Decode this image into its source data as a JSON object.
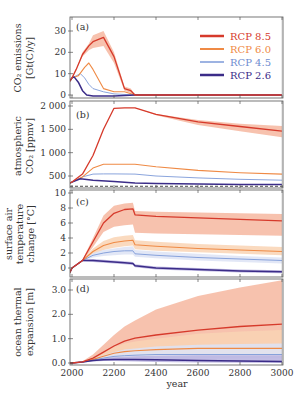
{
  "chart_data": [
    {
      "panel": "(a)",
      "type": "line",
      "ylabel": "CO2 emissions [Gt(C)/y]",
      "ylabel_lines": [
        "CO₂ emissions",
        "[Gt(C)/y]"
      ],
      "yticks": [
        0,
        10,
        20,
        30
      ],
      "ylim": [
        -1.5,
        37
      ],
      "xlim": [
        1990,
        3000
      ],
      "grid": false,
      "legend_position": "upper right",
      "series": [
        {
          "name": "RCP 8.5",
          "color": "#d63a2b",
          "x": [
            1990,
            2000,
            2020,
            2050,
            2080,
            2100,
            2150,
            2200,
            2250,
            2280,
            2300,
            3000
          ],
          "values": [
            6.5,
            8,
            12,
            19,
            23,
            25,
            27,
            18,
            3,
            2,
            0,
            0
          ],
          "band_upper": [
            6.5,
            8,
            12,
            20,
            24,
            28,
            30,
            20,
            4,
            3,
            0,
            0
          ],
          "band_lower": [
            6.5,
            8,
            12,
            18,
            21,
            22,
            23,
            15,
            2,
            1,
            0,
            0
          ]
        },
        {
          "name": "RCP 6.0",
          "color": "#ef8a45",
          "x": [
            1990,
            2000,
            2030,
            2060,
            2080,
            2100,
            2150,
            2200,
            2250,
            2300,
            3000
          ],
          "values": [
            6.5,
            8,
            9,
            13,
            15,
            12,
            3,
            1.5,
            1.5,
            0,
            0
          ]
        },
        {
          "name": "RCP 4.5",
          "color": "#7d9ad8",
          "x": [
            1990,
            2000,
            2020,
            2040,
            2060,
            2080,
            2100,
            2150,
            2200,
            2300,
            3000
          ],
          "values": [
            6.5,
            8,
            9,
            10,
            8,
            5,
            3,
            1.5,
            0.5,
            0,
            0
          ]
        },
        {
          "name": "RCP 2.6",
          "color": "#3b2c88",
          "x": [
            1990,
            2000,
            2010,
            2030,
            2050,
            2070,
            2100,
            2200,
            2300,
            3000
          ],
          "values": [
            6.5,
            8,
            8.5,
            6,
            2,
            0,
            -0.5,
            -0.5,
            0,
            0
          ]
        }
      ]
    },
    {
      "panel": "(b)",
      "type": "line",
      "ylabel": "atmospheric CO2 [ppmv]",
      "ylabel_lines": [
        "atmospheric",
        "CO₂ [ppmv]"
      ],
      "yticks": [
        500,
        1000,
        1500,
        2000
      ],
      "ytick_labels": [
        "500",
        "1 000",
        "1 500",
        "2 000"
      ],
      "ylim": [
        240,
        2100
      ],
      "reference_line": {
        "value": 280,
        "style": "dashed",
        "color": "#333333"
      },
      "series": [
        {
          "name": "RCP 8.5",
          "x": [
            1990,
            2000,
            2050,
            2100,
            2150,
            2200,
            2250,
            2300,
            2400,
            2600,
            2800,
            3000
          ],
          "values": [
            350,
            370,
            540,
            940,
            1500,
            1950,
            1962,
            1962,
            1820,
            1660,
            1560,
            1460
          ],
          "band_upper": [
            350,
            370,
            540,
            940,
            1500,
            1950,
            1962,
            1962,
            1830,
            1700,
            1620,
            1570
          ],
          "band_lower": [
            350,
            370,
            540,
            940,
            1500,
            1950,
            1962,
            1962,
            1800,
            1590,
            1460,
            1330
          ]
        },
        {
          "name": "RCP 6.0",
          "x": [
            1990,
            2000,
            2050,
            2100,
            2150,
            2200,
            2250,
            2300,
            2400,
            2600,
            2800,
            3000
          ],
          "values": [
            350,
            370,
            480,
            670,
            750,
            752,
            752,
            752,
            700,
            620,
            570,
            540
          ]
        },
        {
          "name": "RCP 4.5",
          "x": [
            1990,
            2000,
            2050,
            2100,
            2150,
            2200,
            2300,
            2400,
            2600,
            2800,
            3000
          ],
          "values": [
            350,
            370,
            480,
            540,
            545,
            545,
            540,
            500,
            460,
            430,
            410
          ]
        },
        {
          "name": "RCP 2.6",
          "x": [
            1990,
            2000,
            2040,
            2100,
            2200,
            2300,
            2400,
            2600,
            2800,
            3000
          ],
          "values": [
            350,
            370,
            440,
            410,
            380,
            350,
            340,
            330,
            320,
            315
          ]
        }
      ]
    },
    {
      "panel": "(c)",
      "type": "line",
      "ylabel": "surface air temperature change [°C]",
      "ylabel_lines": [
        "surface air",
        "temperature",
        "change [°C]"
      ],
      "yticks": [
        0,
        2,
        4,
        6,
        8,
        10
      ],
      "ylim": [
        -1.2,
        10.4
      ],
      "series": [
        {
          "name": "RCP 8.5",
          "x": [
            1990,
            2000,
            2050,
            2100,
            2150,
            2200,
            2250,
            2290,
            2300,
            2400,
            2600,
            2800,
            3000
          ],
          "values": [
            -0.6,
            0,
            1,
            3.5,
            6,
            7.3,
            7.8,
            7.9,
            7.1,
            6.9,
            6.7,
            6.5,
            6.3
          ],
          "band_upper": [
            -0.6,
            0,
            1.1,
            4,
            7,
            8.3,
            8.6,
            8.7,
            7.6,
            7.5,
            7.4,
            7.3,
            7.2
          ],
          "band_lower": [
            -0.6,
            0,
            0.9,
            2.8,
            4.8,
            5.5,
            5.7,
            5.8,
            4.7,
            4.6,
            4.5,
            4.4,
            4.3
          ]
        },
        {
          "name": "RCP 6.0",
          "x": [
            1990,
            2000,
            2050,
            2100,
            2150,
            2200,
            2250,
            2290,
            2300,
            2400,
            2600,
            2800,
            3000
          ],
          "values": [
            -0.6,
            0,
            1,
            2.2,
            3,
            3.4,
            3.6,
            3.7,
            3.1,
            2.9,
            2.6,
            2.4,
            2.2
          ],
          "band_upper": [
            -0.6,
            0,
            1.1,
            2.6,
            3.6,
            4.1,
            4.3,
            4.4,
            3.7,
            3.5,
            3.2,
            3.0,
            2.8
          ],
          "band_lower": [
            -0.6,
            0,
            0.9,
            1.8,
            2.4,
            2.7,
            2.9,
            3.0,
            2.5,
            2.3,
            2.1,
            1.9,
            1.7
          ]
        },
        {
          "name": "RCP 4.5",
          "x": [
            1990,
            2000,
            2050,
            2100,
            2150,
            2200,
            2250,
            2290,
            2300,
            2400,
            2600,
            2800,
            3000
          ],
          "values": [
            -0.6,
            0,
            1,
            1.7,
            2.0,
            2.2,
            2.3,
            2.3,
            1.9,
            1.7,
            1.4,
            1.2,
            1.0
          ],
          "band_upper": [
            -0.6,
            0,
            1.1,
            2.0,
            2.4,
            2.6,
            2.8,
            2.9,
            2.4,
            2.2,
            1.9,
            1.6,
            1.4
          ],
          "band_lower": [
            -0.6,
            0,
            0.9,
            1.4,
            1.6,
            1.7,
            1.8,
            1.8,
            1.5,
            1.3,
            1.0,
            0.8,
            0.6
          ]
        },
        {
          "name": "RCP 2.6",
          "x": [
            1990,
            2000,
            2050,
            2100,
            2150,
            2200,
            2250,
            2290,
            2300,
            2400,
            2600,
            2800,
            3000
          ],
          "values": [
            -0.6,
            0,
            1.0,
            1.0,
            0.9,
            0.8,
            0.7,
            0.6,
            0.3,
            0.0,
            -0.2,
            -0.4,
            -0.5
          ],
          "band_upper": [
            -0.6,
            0,
            1.1,
            1.2,
            1.1,
            1.0,
            0.9,
            0.8,
            0.5,
            0.2,
            0.0,
            -0.2,
            -0.3
          ],
          "band_lower": [
            -0.6,
            0,
            0.9,
            0.8,
            0.7,
            0.6,
            0.5,
            0.4,
            0.1,
            -0.2,
            -0.4,
            -0.6,
            -0.7
          ]
        }
      ]
    },
    {
      "panel": "(d)",
      "type": "line",
      "ylabel": "ocean thermal expansion [m]",
      "ylabel_lines": [
        "ocean thermal",
        "expansion [m]"
      ],
      "yticks": [
        0.0,
        1.0,
        2.0,
        3.0
      ],
      "ytick_labels": [
        "0.0",
        "1.0",
        "2.0",
        "3.0"
      ],
      "ylim": [
        -0.05,
        3.5
      ],
      "xlabel": "year",
      "xticks": [
        2000,
        2200,
        2400,
        2600,
        2800,
        3000
      ],
      "series": [
        {
          "name": "RCP 8.5",
          "x": [
            1990,
            2000,
            2050,
            2100,
            2150,
            2200,
            2250,
            2300,
            2400,
            2600,
            2800,
            3000
          ],
          "values": [
            0,
            0,
            0.05,
            0.2,
            0.45,
            0.7,
            0.9,
            1.02,
            1.15,
            1.35,
            1.5,
            1.6
          ],
          "band_upper": [
            0,
            0,
            0.07,
            0.35,
            0.75,
            1.15,
            1.5,
            1.75,
            2.2,
            2.75,
            3.1,
            3.4
          ],
          "band_lower": [
            0,
            0,
            0.03,
            0.12,
            0.25,
            0.38,
            0.48,
            0.55,
            0.58,
            0.6,
            0.62,
            0.63
          ]
        },
        {
          "name": "RCP 6.0",
          "x": [
            1990,
            2000,
            2050,
            2100,
            2150,
            2200,
            2250,
            2300,
            2400,
            2600,
            2800,
            3000
          ],
          "values": [
            0,
            0,
            0.04,
            0.15,
            0.28,
            0.4,
            0.47,
            0.5,
            0.55,
            0.6,
            0.6,
            0.6
          ],
          "band_upper": [
            0,
            0,
            0.06,
            0.25,
            0.45,
            0.65,
            0.8,
            0.88,
            1.0,
            1.2,
            1.3,
            1.35
          ],
          "band_lower": [
            0,
            0,
            0.02,
            0.1,
            0.18,
            0.24,
            0.28,
            0.3,
            0.3,
            0.3,
            0.3,
            0.3
          ]
        },
        {
          "name": "RCP 4.5",
          "x": [
            1990,
            2000,
            2050,
            2100,
            2150,
            2200,
            2250,
            2300,
            2400,
            2600,
            2800,
            3000
          ],
          "values": [
            0,
            0,
            0.04,
            0.12,
            0.2,
            0.27,
            0.3,
            0.32,
            0.35,
            0.35,
            0.35,
            0.35
          ],
          "band_upper": [
            0,
            0,
            0.05,
            0.2,
            0.32,
            0.45,
            0.55,
            0.6,
            0.68,
            0.75,
            0.78,
            0.8
          ],
          "band_lower": [
            0,
            0,
            0.02,
            0.07,
            0.12,
            0.15,
            0.17,
            0.18,
            0.18,
            0.18,
            0.18,
            0.18
          ]
        },
        {
          "name": "RCP 2.6",
          "x": [
            1990,
            2000,
            2050,
            2100,
            2150,
            2200,
            2250,
            2300,
            2400,
            2600,
            2800,
            3000
          ],
          "values": [
            0,
            0,
            0.04,
            0.1,
            0.13,
            0.14,
            0.14,
            0.14,
            0.13,
            0.1,
            0.08,
            0.06
          ],
          "band_upper": [
            0,
            0,
            0.05,
            0.14,
            0.2,
            0.24,
            0.26,
            0.28,
            0.3,
            0.32,
            0.32,
            0.32
          ],
          "band_lower": [
            0,
            0,
            0.02,
            0.06,
            0.08,
            0.08,
            0.07,
            0.06,
            0.04,
            0.02,
            0.01,
            0.0
          ]
        }
      ]
    }
  ],
  "legend": [
    {
      "label": "RCP 8.5",
      "color": "#d63a2b"
    },
    {
      "label": "RCP 6.0",
      "color": "#ef8a45"
    },
    {
      "label": "RCP 4.5",
      "color": "#7d9ad8"
    },
    {
      "label": "RCP 2.6",
      "color": "#3b2c88"
    }
  ],
  "panel_labels": [
    "(a)",
    "(b)",
    "(c)",
    "(d)"
  ],
  "xaxis": {
    "label": "year",
    "ticks": [
      "2000",
      "2200",
      "2400",
      "2600",
      "2800",
      "3000"
    ]
  },
  "colors": {
    "rcp85": "#d63a2b",
    "rcp85_band": "#f6b7a0",
    "rcp60": "#ef8a45",
    "rcp60_band": "#f9d3b4",
    "rcp45": "#7d9ad8",
    "rcp45_band": "#dde3f4",
    "rcp26": "#3b2c88",
    "rcp26_band": "#b9b1df",
    "axis": "#555555",
    "text": "#333333"
  }
}
